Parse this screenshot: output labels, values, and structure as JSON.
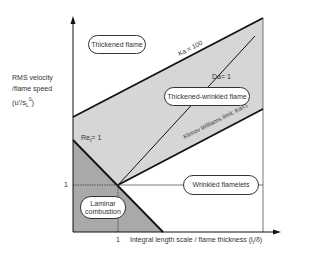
{
  "diagram": {
    "y_axis": {
      "label_line1": "RMS velocity",
      "label_line2": "/flame speed",
      "label_line3": "(u'/s",
      "label_sub": "L",
      "label_sup": "0",
      "label_close": ")",
      "tick": "1"
    },
    "x_axis": {
      "label": "Integral length scale / flame thickness (l",
      "label_sub": "t",
      "label_close": "/δ)",
      "tick": "1"
    },
    "lines": {
      "ka100": "Ka = 100",
      "da1": "Da= 1",
      "klimov": "Klimov  Williams  limit:  Ka=1",
      "re_prefix": "Re",
      "re_sub": "t",
      "re_suffix": "= 1"
    },
    "regimes": {
      "thickened": "Thickened flame",
      "thickened_wrinkled": "Thickened-wrinkled  flame",
      "wrinkled": "Wrinkled  flamelets",
      "laminar_line1": "Laminar",
      "laminar_line2": "combustion"
    },
    "colors": {
      "shade_light": "#d4d4d4",
      "shade_dark": "#a8a8a8",
      "line": "#111111"
    }
  }
}
